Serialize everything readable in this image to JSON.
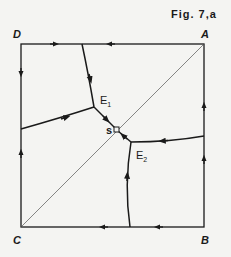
{
  "figure": {
    "title": "Fig. 7,a",
    "corners": {
      "A": "A",
      "B": "B",
      "C": "C",
      "D": "D"
    },
    "equilibria": {
      "E1": {
        "base": "E",
        "sub": "1"
      },
      "E2": {
        "base": "E",
        "sub": "2"
      },
      "S": "s"
    },
    "colors": {
      "ink": "#1a1a1a",
      "background": "#f4f4f2",
      "diagonal": "#555555"
    }
  }
}
